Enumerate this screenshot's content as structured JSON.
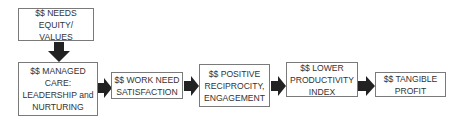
{
  "diagram": {
    "type": "flowchart",
    "nodes": [
      {
        "id": "needs",
        "label": "$$ NEEDS EQUITY/ VALUES"
      },
      {
        "id": "care",
        "label": "$$ MANAGED CARE: LEADERSHIP and NURTURING"
      },
      {
        "id": "work",
        "label": "$$ WORK NEED SATISFACTION"
      },
      {
        "id": "recip",
        "label": "$$ POSITIVE RECIPROCITY, ENGAGEMENT"
      },
      {
        "id": "prod",
        "label": "$$ LOWER PRODUCTIVITY INDEX"
      },
      {
        "id": "profit",
        "label": "$$ TANGIBLE PROFIT"
      }
    ],
    "edges": [
      {
        "from": "needs",
        "to": "care",
        "direction": "down"
      },
      {
        "from": "care",
        "to": "work",
        "direction": "right"
      },
      {
        "from": "work",
        "to": "recip",
        "direction": "right"
      },
      {
        "from": "recip",
        "to": "prod",
        "direction": "right"
      },
      {
        "from": "prod",
        "to": "profit",
        "direction": "right"
      }
    ],
    "colors": {
      "border": "#7a7a7a",
      "arrow": "#222222",
      "text": "#333333"
    }
  }
}
